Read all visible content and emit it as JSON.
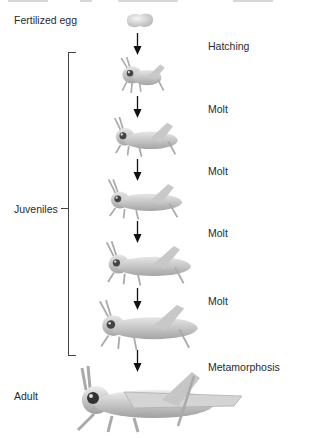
{
  "diagram": {
    "title_cut_off": "",
    "egg_label": "Fertilized egg",
    "juveniles_label": "Juveniles",
    "adult_label": "Adult",
    "transitions": [
      {
        "label": "Hatching"
      },
      {
        "label": "Molt"
      },
      {
        "label": "Molt"
      },
      {
        "label": "Molt"
      },
      {
        "label": "Molt"
      },
      {
        "label": "Metamorphosis"
      }
    ],
    "stages": [
      {
        "name": "egg"
      },
      {
        "name": "juvenile-1"
      },
      {
        "name": "juvenile-2"
      },
      {
        "name": "juvenile-3"
      },
      {
        "name": "juvenile-4"
      },
      {
        "name": "juvenile-5"
      },
      {
        "name": "adult"
      }
    ],
    "colors": {
      "insect_body": "#cfcfcf",
      "insect_shade": "#9a9a9a",
      "arrow": "#111111",
      "bracket": "#444444",
      "text": "#2a2a2a"
    }
  }
}
